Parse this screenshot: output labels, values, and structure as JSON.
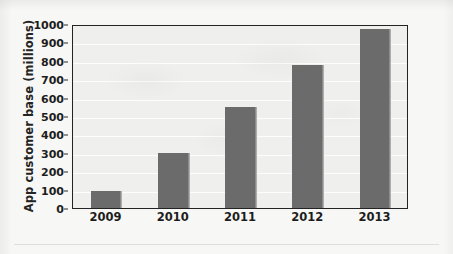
{
  "chart_data": {
    "type": "bar",
    "title": "",
    "subtitle": "",
    "xlabel": "",
    "ylabel": "App customer base (millions)",
    "categories": [
      "2009",
      "2010",
      "2011",
      "2012",
      "2013"
    ],
    "values": [
      95,
      300,
      550,
      775,
      975
    ],
    "series": [
      {
        "name": "App customer base",
        "values": [
          95,
          300,
          550,
          775,
          975
        ]
      }
    ],
    "ylim": [
      0,
      1000
    ],
    "ytick_values": [
      0,
      100,
      200,
      300,
      400,
      500,
      600,
      700,
      800,
      900,
      1000
    ],
    "ytick_labels": [
      "0",
      "100",
      "200",
      "300",
      "400",
      "500",
      "600",
      "700",
      "800",
      "900",
      "1000"
    ],
    "grid": true,
    "grid_axis": "y",
    "legend": false,
    "legend_position": "none",
    "bar_color": "#6b6b6b",
    "plot_background": "#efefed",
    "axis_color": "#232323",
    "gridline_color": "#ffffff",
    "text_color": "#1d1d1d"
  }
}
